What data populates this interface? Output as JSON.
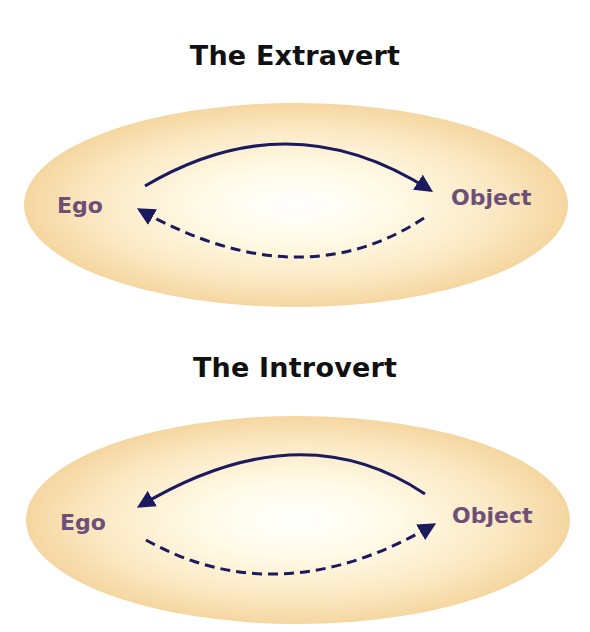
{
  "colors": {
    "label": "#6e4f78",
    "arrow": "#1c1a5e",
    "ellipse_center": "#fffef6",
    "ellipse_edge": "#f5d9a6"
  },
  "diagrams": [
    {
      "title": "The Extravert",
      "left_label": "Ego",
      "right_label": "Object",
      "solid_arrow": "Ego → Object (top, solid)",
      "dashed_arrow": "Object → Ego (bottom, dashed)"
    },
    {
      "title": "The Introvert",
      "left_label": "Ego",
      "right_label": "Object",
      "solid_arrow": "Object → Ego (top, solid)",
      "dashed_arrow": "Ego → Object (bottom, dashed)"
    }
  ]
}
